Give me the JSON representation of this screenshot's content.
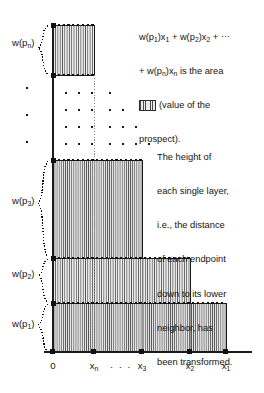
{
  "figure": {
    "kind": "rank-dependent-utility-layer-diagram",
    "background": "#ffffff",
    "ink": "#141414",
    "hatch_color": "#4a4a4a",
    "hatch_bg": "#e9e9e9"
  },
  "formula": {
    "line1": "w(p1)x1 + w(p2)x2 + ⋯",
    "line1_parts": [
      "w(p",
      "1",
      ")x",
      "1",
      " + w(p",
      "2",
      ")x",
      "2",
      " + ⋯"
    ],
    "line2": "+ w(pn)xn is the area",
    "line3_suffix": "(value of the",
    "line4": "prospect).",
    "swatch_name": "area-swatch"
  },
  "explanation": {
    "text": "The height of each single layer, i.e., the distance of each endpoint down to its lower neighbor, has been transformed.",
    "lines": [
      "The height of",
      "each single layer,",
      "i.e., the distance",
      "of each endpoint",
      "down to its lower",
      "neighbor, has",
      "been transformed."
    ]
  },
  "axis": {
    "origin_label": "0",
    "ticks": [
      {
        "id": "x0",
        "label": "0",
        "sub": "",
        "x": 53,
        "show_sub": false
      },
      {
        "id": "xn",
        "label": "x",
        "sub": "n",
        "x": 94,
        "show_sub": true
      },
      {
        "id": "x3",
        "label": "x",
        "sub": "3",
        "x": 142,
        "show_sub": true
      },
      {
        "id": "x2",
        "label": "x",
        "sub": "2",
        "x": 190,
        "show_sub": true
      },
      {
        "id": "x1",
        "label": "x",
        "sub": "1",
        "x": 226,
        "show_sub": true
      }
    ],
    "ellipsis": "· · ·",
    "ellipsis_x": 118,
    "baseline_y": 352,
    "axis_right": 252
  },
  "weights": [
    {
      "id": "wpn",
      "label": "w(p",
      "sub": "n",
      "close": ")",
      "label_y": 44,
      "brace_top": 25,
      "brace_bottom": 75
    },
    {
      "id": "wp3",
      "label": "w(p",
      "sub": "3",
      "close": ")",
      "label_y": 202,
      "brace_top": 160,
      "brace_bottom": 258
    },
    {
      "id": "wp2",
      "label": "w(p",
      "sub": "2",
      "close": ")",
      "label_y": 275,
      "brace_top": 258,
      "brace_bottom": 303
    },
    {
      "id": "wp1",
      "label": "w(p",
      "sub": "1",
      "close": ")",
      "label_y": 325,
      "brace_top": 303,
      "brace_bottom": 352
    }
  ],
  "layers": [
    {
      "id": "layer-n",
      "x_left": 53,
      "x_right": 94,
      "y_top": 25,
      "y_bottom": 75,
      "weight_id": "wpn"
    },
    {
      "id": "layer-3",
      "x_left": 53,
      "x_right": 142,
      "y_top": 160,
      "y_bottom": 258,
      "weight_id": "wp3"
    },
    {
      "id": "layer-2",
      "x_left": 53,
      "x_right": 190,
      "y_top": 258,
      "y_bottom": 303,
      "weight_id": "wp2"
    },
    {
      "id": "layer-1",
      "x_left": 53,
      "x_right": 226,
      "y_top": 303,
      "y_bottom": 352,
      "weight_id": "wp1"
    }
  ],
  "dot_matrix": {
    "rows": [
      {
        "y": 93,
        "xs": [
          66,
          79,
          92,
          110
        ]
      },
      {
        "y": 110,
        "xs": [
          66,
          79,
          92,
          110,
          123
        ]
      },
      {
        "y": 127,
        "xs": [
          66,
          79,
          92,
          110,
          123,
          136
        ]
      },
      {
        "y": 144,
        "xs": [
          66,
          79,
          92,
          110,
          123,
          136,
          149
        ]
      }
    ],
    "left_dots": [
      {
        "x": 27,
        "y": 88
      },
      {
        "x": 27,
        "y": 115
      },
      {
        "x": 27,
        "y": 142
      }
    ]
  },
  "vertical_dotted_x": 94
}
